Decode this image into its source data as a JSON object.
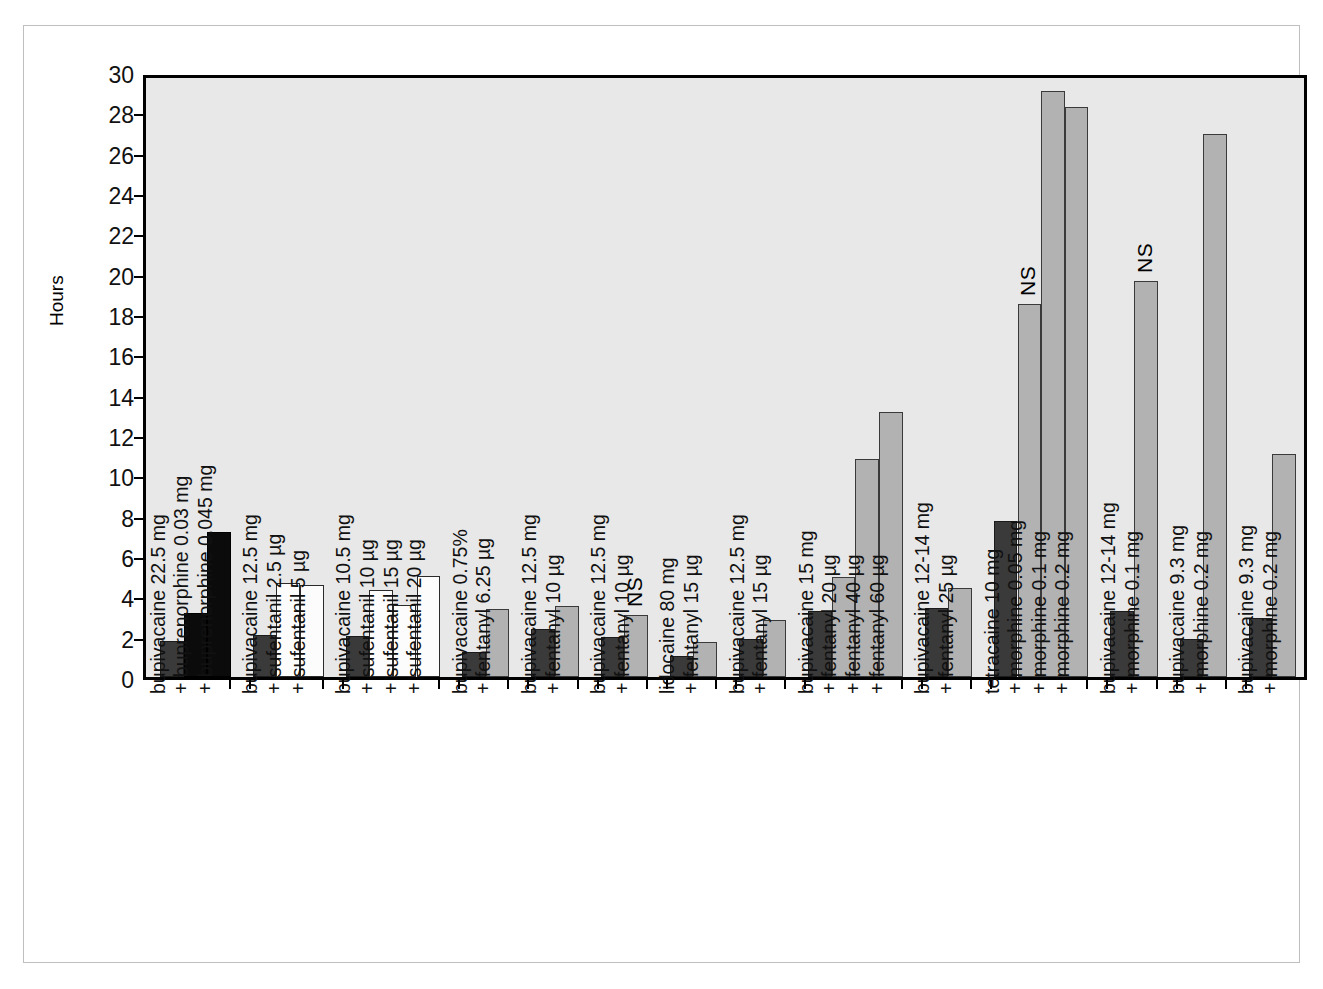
{
  "chart_data": {
    "type": "bar",
    "title": "",
    "subtitle": "",
    "xlabel": "",
    "ylabel": "Hours",
    "ylim": [
      0,
      30
    ],
    "ytick_step": 2,
    "yticks": [
      30,
      28,
      26,
      24,
      22,
      20,
      18,
      16,
      14,
      12,
      10,
      8,
      6,
      4,
      2,
      0
    ],
    "grid": false,
    "legend": "none",
    "colors": {
      "dark_gray": "#3a3a3a",
      "black": "#0b0b0b",
      "white": "#fcfcfc",
      "light_gray": "#b2b2b2",
      "plot_background": "#e8e8e8",
      "axis": "#000000",
      "outer_border": "#bfbfbf"
    },
    "annotations": [
      {
        "text": "NS",
        "group_index": 5,
        "bar_index": 1
      },
      {
        "text": "NS",
        "group_index": 10,
        "bar_index": 1
      },
      {
        "text": "NS",
        "group_index": 11,
        "bar_index": 1
      }
    ],
    "groups": [
      {
        "id": "group-buprenorphine",
        "label_lines": [
          "bupivacaine  22.5 mg",
          "+  buprenorphine  0.03 mg",
          "+  buprenorphine  0.045 mg"
        ],
        "bars": [
          {
            "value": 1.8,
            "fill": "dark_gray"
          },
          {
            "value": 3.2,
            "fill": "black"
          },
          {
            "value": 7.25,
            "fill": "black"
          }
        ]
      },
      {
        "id": "group-sufentanil-2p5-5",
        "label_lines": [
          "bupivacaine 12.5 mg",
          "+  sufentanil 2.5 µg",
          "+  sufentanil 5 µg"
        ],
        "bars": [
          {
            "value": 2.1,
            "fill": "dark_gray"
          },
          {
            "value": 4.7,
            "fill": "white"
          },
          {
            "value": 4.6,
            "fill": "white"
          }
        ]
      },
      {
        "id": "group-sufentanil-10-15-20",
        "label_lines": [
          "bupivacaine 10.5 mg",
          "+  sufentanil 10 µg",
          "+  sufentanil 15 µg",
          "+  sufentanil 20 µg"
        ],
        "bars": [
          {
            "value": 2.05,
            "fill": "dark_gray"
          },
          {
            "value": 4.35,
            "fill": "white"
          },
          {
            "value": 3.6,
            "fill": "white"
          },
          {
            "value": 5.05,
            "fill": "white"
          }
        ]
      },
      {
        "id": "group-fentanyl-6p25",
        "label_lines": [
          "bupivacaine 0.75%",
          "+ fentanyl 6.25 µg"
        ],
        "bars": [
          {
            "value": 1.25,
            "fill": "dark_gray"
          },
          {
            "value": 3.4,
            "fill": "light_gray"
          }
        ]
      },
      {
        "id": "group-fentanyl-10-a",
        "label_lines": [
          "bupivacaine 12.5 mg",
          "+  fentanyl 10 µg"
        ],
        "bars": [
          {
            "value": 2.4,
            "fill": "dark_gray"
          },
          {
            "value": 3.55,
            "fill": "light_gray"
          }
        ]
      },
      {
        "id": "group-fentanyl-10-b",
        "label_lines": [
          "bupivacaine 12.5 mg",
          "+  fentanyl 10 µg"
        ],
        "bars": [
          {
            "value": 2.0,
            "fill": "dark_gray"
          },
          {
            "value": 3.1,
            "fill": "light_gray"
          }
        ]
      },
      {
        "id": "group-lidocaine-fentanyl-15",
        "label_lines": [
          "lidocaine 80 mg",
          "+  fentanyl 15 µg"
        ],
        "bars": [
          {
            "value": 1.05,
            "fill": "dark_gray"
          },
          {
            "value": 1.75,
            "fill": "light_gray"
          }
        ]
      },
      {
        "id": "group-fentanyl-15",
        "label_lines": [
          "bupivacaine 12.5 mg",
          "+  fentanyl 15 µg"
        ],
        "bars": [
          {
            "value": 1.9,
            "fill": "dark_gray"
          },
          {
            "value": 2.85,
            "fill": "light_gray"
          }
        ]
      },
      {
        "id": "group-fentanyl-20-40-60",
        "label_lines": [
          "bupivacaine 15 mg",
          "+  fentanyl 20 µg",
          "+  fentanyl 40 µg",
          "+  fentanyl 60 µg"
        ],
        "bars": [
          {
            "value": 3.3,
            "fill": "dark_gray"
          },
          {
            "value": 5.0,
            "fill": "light_gray"
          },
          {
            "value": 10.9,
            "fill": "light_gray"
          },
          {
            "value": 13.25,
            "fill": "light_gray"
          }
        ]
      },
      {
        "id": "group-fentanyl-25",
        "label_lines": [
          "bupivacaine 12-14 mg",
          "+  fentanyl 25 µg"
        ],
        "bars": [
          {
            "value": 3.45,
            "fill": "dark_gray"
          },
          {
            "value": 4.45,
            "fill": "light_gray"
          }
        ]
      },
      {
        "id": "group-tetracaine-morphine",
        "label_lines": [
          "tetracaine 10 mg",
          "+  morphine 0.05 mg",
          "+  morphine 0.1 mg",
          "+  morphine 0.2 mg"
        ],
        "bars": [
          {
            "value": 7.8,
            "fill": "dark_gray"
          },
          {
            "value": 18.7,
            "fill": "light_gray"
          },
          {
            "value": 29.35,
            "fill": "light_gray"
          },
          {
            "value": 28.55,
            "fill": "light_gray"
          }
        ]
      },
      {
        "id": "group-morphine-0p1",
        "label_lines": [
          "bupivacaine 12-14 mg",
          "+  morphine 0.1 mg"
        ],
        "bars": [
          {
            "value": 3.3,
            "fill": "dark_gray"
          },
          {
            "value": 19.85,
            "fill": "light_gray"
          }
        ]
      },
      {
        "id": "group-morphine-0p2-a",
        "label_lines": [
          "bupivacaine 9.3 mg",
          "+  morphine 0.2 mg"
        ],
        "bars": [
          {
            "value": 1.9,
            "fill": "dark_gray"
          },
          {
            "value": 27.2,
            "fill": "light_gray"
          }
        ]
      },
      {
        "id": "group-morphine-0p2-b",
        "label_lines": [
          "bupivacaine 9.3 mg",
          "+  morphine 0.2 mg"
        ],
        "bars": [
          {
            "value": 2.95,
            "fill": "dark_gray"
          },
          {
            "value": 11.15,
            "fill": "light_gray"
          }
        ]
      }
    ]
  }
}
